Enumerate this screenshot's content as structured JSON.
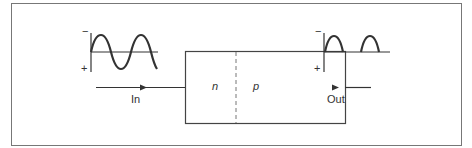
{
  "diagram": {
    "input_label": "In",
    "output_label": "Out",
    "region_left": "n",
    "region_right": "p",
    "input_axis": {
      "top_sign": "−",
      "bottom_sign": "+"
    },
    "output_axis": {
      "top_sign": "−",
      "bottom_sign": "+"
    },
    "input_waveform": "full sine wave (2 cycles)",
    "output_waveform": "half-wave rectified (2 positive humps)"
  },
  "colors": {
    "stroke": "#333333",
    "frame": "#777777",
    "background": "#ffffff"
  }
}
